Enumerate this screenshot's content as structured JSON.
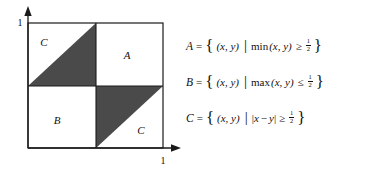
{
  "diagram": {
    "name": "unit-square-set-diagram",
    "axes": {
      "y_tick_label": "1",
      "x_tick_label": "1",
      "y_axis_name": "y-axis",
      "x_axis_name": "x-axis",
      "arrow_icon": "arrowhead-icon"
    },
    "square": {
      "left": 28,
      "top": 23,
      "right": 163,
      "bottom": 148,
      "center_x": 96,
      "center_y": 86,
      "border_color": "#1a1a1a",
      "fill_color": "#ffffff"
    },
    "shaded_color": "#4a4a4a",
    "shaded_regions": [
      {
        "name": "upper-left-shaded-triangle",
        "points": "28,86 96,23 96,86"
      },
      {
        "name": "lower-right-shaded-triangle",
        "points": "96,86 163,86 96,148"
      }
    ],
    "region_labels": [
      {
        "text": "C",
        "x": 44,
        "y": 42,
        "name": "region-label-c-upper-left"
      },
      {
        "text": "A",
        "x": 127,
        "y": 55,
        "name": "region-label-a"
      },
      {
        "text": "B",
        "x": 57,
        "y": 120,
        "name": "region-label-b"
      },
      {
        "text": "C",
        "x": 141,
        "y": 130,
        "name": "region-label-c-lower-right"
      }
    ]
  },
  "equations": [
    {
      "name": "equation-set-a",
      "set_name": "A",
      "equals": "=",
      "brace_open": "{",
      "brace_close": "}",
      "tuple": "(x, y)",
      "divider": "|",
      "function": "min",
      "arguments": "(x, y)",
      "relation": "≥",
      "value_numerator": "1",
      "value_denominator": "2",
      "plain_text": "A = { (x, y) | min(x, y) ≥ 1/2 }"
    },
    {
      "name": "equation-set-b",
      "set_name": "B",
      "equals": "=",
      "brace_open": "{",
      "brace_close": "}",
      "tuple": "(x, y)",
      "divider": "|",
      "function": "max",
      "arguments": "(x, y)",
      "relation": "≤",
      "value_numerator": "1",
      "value_denominator": "2",
      "plain_text": "B = { (x, y) | max(x, y) ≤ 1/2 }"
    },
    {
      "name": "equation-set-c",
      "set_name": "C",
      "equals": "=",
      "brace_open": "{",
      "brace_close": "}",
      "tuple": "(x, y)",
      "divider": "|",
      "abs_open": "|",
      "abs_left_var": "x",
      "minus": "−",
      "abs_right_var": "y",
      "abs_close": "|",
      "relation": "≥",
      "value_numerator": "1",
      "value_denominator": "2",
      "plain_text": "C = { (x, y) | |x − y| ≥ 1/2 }"
    }
  ]
}
